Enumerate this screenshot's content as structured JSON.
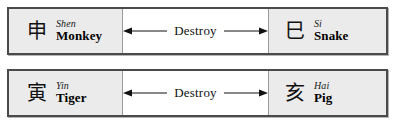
{
  "figure": {
    "type": "branch-relation-table",
    "background_color": "#ffffff",
    "cell_shade_color": "#ebebeb",
    "border_color": "#4a4a4a",
    "divider_color": "#9a9a9a"
  },
  "rows": [
    {
      "left": {
        "glyph": "申",
        "pinyin": "Shen",
        "animal": "Monkey"
      },
      "relation": {
        "label": "Destroy",
        "left_arrow": "left-arrow-icon",
        "right_arrow": "right-arrow-icon"
      },
      "right": {
        "glyph": "巳",
        "pinyin": "Si",
        "animal": "Snake"
      }
    },
    {
      "left": {
        "glyph": "寅",
        "pinyin": "Yin",
        "animal": "Tiger"
      },
      "relation": {
        "label": "Destroy",
        "left_arrow": "left-arrow-icon",
        "right_arrow": "right-arrow-icon"
      },
      "right": {
        "glyph": "亥",
        "pinyin": "Hai",
        "animal": "Pig"
      }
    }
  ]
}
